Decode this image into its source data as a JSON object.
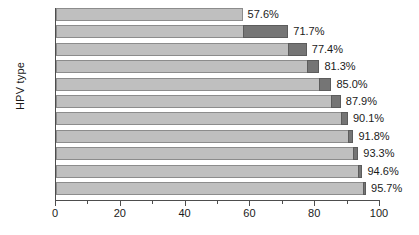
{
  "chart_data": {
    "type": "bar",
    "orientation": "horizontal",
    "stacked": true,
    "title": "",
    "subtitle": "",
    "xlabel": "",
    "ylabel": "HPV type",
    "xlim": [
      0,
      100
    ],
    "xticks": [
      0,
      20,
      40,
      60,
      80,
      100
    ],
    "xtick_labels": [
      "0",
      "20",
      "40",
      "60",
      "80",
      "100"
    ],
    "minor_xticks": [
      10,
      30,
      50,
      70,
      90
    ],
    "grid": false,
    "legend": [],
    "categories": [
      "16",
      "+ 18",
      "+ 45",
      "+ 31",
      "+ X",
      "+ 33",
      "+ 52",
      "+ 58",
      "+ 35",
      "+ 59",
      "+ 56"
    ],
    "values": [
      57.6,
      71.7,
      77.4,
      81.3,
      85.0,
      87.9,
      90.1,
      91.8,
      93.3,
      94.6,
      95.7
    ],
    "value_labels": [
      "57.6%",
      "71.7%",
      "77.4%",
      "81.3%",
      "85.0%",
      "87.9%",
      "90.1%",
      "91.8%",
      "93.3%",
      "94.6%",
      "95.7%"
    ],
    "series": [
      {
        "name": "cumulative-base",
        "values": [
          0,
          57.6,
          71.7,
          77.4,
          81.3,
          85.0,
          87.9,
          90.1,
          91.8,
          93.3,
          94.6
        ],
        "color": "#bfbfbf"
      },
      {
        "name": "increment",
        "values": [
          57.6,
          14.1,
          5.7,
          3.9,
          3.7,
          2.9,
          2.2,
          1.7,
          1.5,
          1.3,
          1.1
        ],
        "color": "#757575"
      }
    ],
    "colors": {
      "base_fill": "#bfbfbf",
      "base_stroke": "#8c8c8c",
      "increment_fill": "#757575",
      "increment_stroke": "#5c5c5c",
      "axis": "#4d4d4d",
      "text": "#1a1a1a",
      "background": "#ffffff"
    }
  }
}
